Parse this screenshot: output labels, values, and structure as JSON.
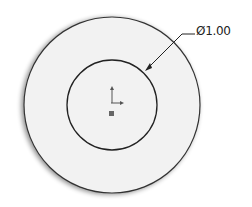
{
  "drawing": {
    "dimension_label": "Ø1.00",
    "outer_circle": {
      "cx": 112,
      "cy": 105,
      "r": 88,
      "fill": "#f2f2f2",
      "stroke": "#333333"
    },
    "inner_circle": {
      "cx": 112,
      "cy": 105,
      "r": 45,
      "stroke": "#222222"
    },
    "origin_marker": {
      "x": 112,
      "y": 105
    }
  }
}
